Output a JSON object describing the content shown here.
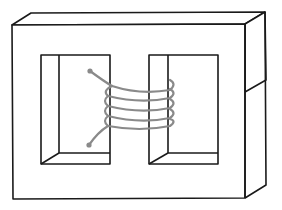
{
  "diagram": {
    "colors": {
      "background": "#ffffff",
      "core_outline": "#1a1a1a",
      "coil": "#8a8a8a"
    },
    "elements": [
      {
        "name": "core",
        "description": "rectangular laminated core drawn in 3D perspective with two windows"
      },
      {
        "name": "left-window",
        "description": "left rectangular opening in core"
      },
      {
        "name": "right-window",
        "description": "right rectangular opening in core"
      },
      {
        "name": "coil",
        "description": "helical winding with 4 turns around central limb, two terminal leads with dots"
      }
    ],
    "coil_turns": 4
  }
}
